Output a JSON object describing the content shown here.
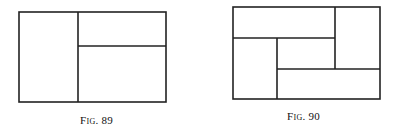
{
  "figures": [
    {
      "caption": "Fig. 89",
      "outer": {
        "x": 19,
        "y": 12,
        "w": 147,
        "h": 90
      },
      "lines": [
        {
          "x1": 78,
          "y1": 12,
          "x2": 78,
          "y2": 102
        },
        {
          "x1": 78,
          "y1": 46,
          "x2": 166,
          "y2": 46
        }
      ]
    },
    {
      "caption": "Fig. 90",
      "outer": {
        "x": 233,
        "y": 7,
        "w": 147,
        "h": 92
      },
      "lines": [
        {
          "x1": 335,
          "y1": 7,
          "x2": 335,
          "y2": 69
        },
        {
          "x1": 233,
          "y1": 38,
          "x2": 335,
          "y2": 38
        },
        {
          "x1": 277,
          "y1": 38,
          "x2": 277,
          "y2": 99
        },
        {
          "x1": 277,
          "y1": 69,
          "x2": 380,
          "y2": 69
        }
      ]
    }
  ]
}
